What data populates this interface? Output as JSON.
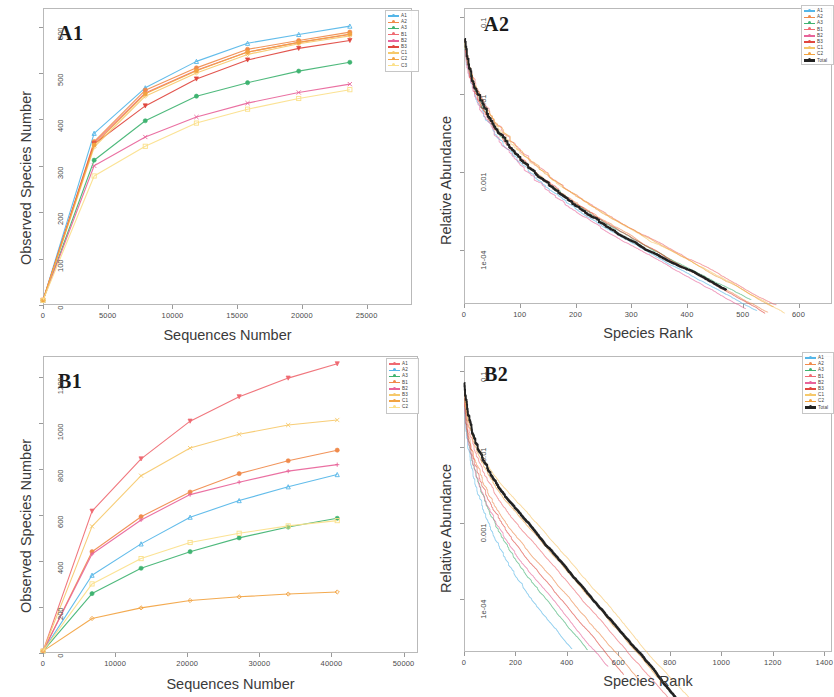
{
  "figure": {
    "width": 832,
    "height": 697,
    "background": "#ffffff"
  },
  "palette": {
    "A1": "#55b6e8",
    "A2": "#f08a4b",
    "A3": "#3fb371",
    "B1": "#ef6a72",
    "B2": "#e8649a",
    "B3": "#e0473f",
    "C1": "#f6c96b",
    "C2": "#f2a341",
    "C3": "#fbe08a",
    "total": "#222222"
  },
  "panels": [
    {
      "id": "A1",
      "tag": "A1",
      "chart_data": {
        "type": "line",
        "title": "A1",
        "xlabel": "Sequences Number",
        "ylabel": "Observed Species Number",
        "xlim": [
          0,
          28500
        ],
        "ylim": [
          0,
          640
        ],
        "xticks": [
          0,
          5000,
          10000,
          15000,
          20000,
          25000
        ],
        "yticks": [
          0,
          100,
          200,
          300,
          400,
          500,
          600
        ],
        "grid": false,
        "legend_position": "top-right",
        "x": [
          0,
          3950,
          7900,
          11850,
          15800,
          19750,
          23700
        ],
        "series": [
          {
            "name": "A1",
            "color": "#55b6e8",
            "marker": "triangle",
            "values": [
              10,
              370,
              468,
              525,
              564,
              583,
              601
            ]
          },
          {
            "name": "A2",
            "color": "#f08a4b",
            "marker": "circle",
            "values": [
              10,
              352,
              463,
              511,
              551,
              570,
              588
            ]
          },
          {
            "name": "A3",
            "color": "#3fb371",
            "marker": "circle",
            "values": [
              10,
              312,
              397,
              450,
              479,
              504,
              523
            ]
          },
          {
            "name": "B1",
            "color": "#ef6a72",
            "marker": "plus",
            "values": [
              10,
              349,
              457,
              506,
              545,
              566,
              583
            ]
          },
          {
            "name": "B2",
            "color": "#e8649a",
            "marker": "cross",
            "values": [
              10,
              300,
              362,
              405,
              435,
              458,
              476
            ]
          },
          {
            "name": "B3",
            "color": "#e0473f",
            "marker": "triangle-down",
            "values": [
              10,
              347,
              429,
              487,
              528,
              553,
              570
            ]
          },
          {
            "name": "C1",
            "color": "#f6c96b",
            "marker": "diamond",
            "values": [
              10,
              340,
              450,
              500,
              540,
              563,
              580
            ]
          },
          {
            "name": "C2",
            "color": "#f2a341",
            "marker": "circle",
            "values": [
              10,
              345,
              455,
              505,
              545,
              566,
              584
            ]
          },
          {
            "name": "C3",
            "color": "#fbe08a",
            "marker": "square",
            "values": [
              10,
              278,
              342,
              392,
              422,
              445,
              464
            ]
          }
        ],
        "legend": [
          "A1",
          "A2",
          "A3",
          "B1",
          "B2",
          "B3",
          "C1",
          "C2",
          "C3"
        ]
      }
    },
    {
      "id": "A2",
      "tag": "A2",
      "chart_data": {
        "type": "line",
        "title": "A2",
        "xlabel": "Species Rank",
        "ylabel": "Relative Abundance",
        "xlim": [
          0,
          660
        ],
        "ylim": [
          2e-05,
          0.13
        ],
        "yscale": "log",
        "xticks": [
          0,
          100,
          200,
          300,
          400,
          500,
          600
        ],
        "yticks": [
          0.1,
          0.01,
          0.001,
          0.0001
        ],
        "ytick_labels": [
          "0.1",
          "0.01",
          "0.001",
          "1e-04"
        ],
        "grid": false,
        "legend_position": "top-right",
        "legend": [
          "A1",
          "A2",
          "A3",
          "B1",
          "B2",
          "B3",
          "C1",
          "C2",
          "Total"
        ],
        "series": [
          {
            "name": "A1",
            "color": "#55b6e8",
            "tail_rank": 525
          },
          {
            "name": "A2",
            "color": "#f08a4b",
            "tail_rank": 545
          },
          {
            "name": "A3",
            "color": "#3fb371",
            "tail_rank": 515
          },
          {
            "name": "B1",
            "color": "#ef6a72",
            "tail_rank": 560
          },
          {
            "name": "B2",
            "color": "#e8649a",
            "tail_rank": 505
          },
          {
            "name": "B3",
            "color": "#e0473f",
            "tail_rank": 540
          },
          {
            "name": "C1",
            "color": "#f6c96b",
            "tail_rank": 575
          },
          {
            "name": "C2",
            "color": "#f2a341",
            "tail_rank": 555
          },
          {
            "name": "Total",
            "color": "#222222",
            "tail_rank": 470,
            "emphasis": true
          }
        ]
      }
    },
    {
      "id": "B1",
      "tag": "B1",
      "chart_data": {
        "type": "line",
        "title": "B1",
        "xlabel": "Sequences Number",
        "ylabel": "Observed Species Number",
        "xlim": [
          0,
          52000
        ],
        "ylim": [
          0,
          1290
        ],
        "xticks": [
          0,
          10000,
          20000,
          30000,
          40000,
          50000
        ],
        "yticks": [
          0,
          200,
          400,
          600,
          800,
          1000,
          1200
        ],
        "grid": false,
        "legend_position": "top-right",
        "x": [
          0,
          6800,
          13600,
          20400,
          27200,
          34000,
          40800
        ],
        "series": [
          {
            "name": "A1",
            "color": "#ef6a72",
            "marker": "triangle-down",
            "values": [
              8,
              616,
              843,
              1007,
              1113,
              1194,
              1256
            ]
          },
          {
            "name": "A2",
            "color": "#55b6e8",
            "marker": "triangle",
            "values": [
              8,
              338,
              474,
              590,
              662,
              722,
              775
            ]
          },
          {
            "name": "A3",
            "color": "#3fb371",
            "marker": "circle",
            "values": [
              8,
              258,
              368,
              440,
              500,
              547,
              585
            ]
          },
          {
            "name": "B1",
            "color": "#f08a4b",
            "marker": "circle",
            "values": [
              8,
              440,
              592,
              699,
              779,
              835,
              881
            ]
          },
          {
            "name": "B2",
            "color": "#e8649a",
            "marker": "plus",
            "values": [
              8,
              430,
              578,
              688,
              742,
              790,
              818
            ]
          },
          {
            "name": "B3",
            "color": "#f6c96b",
            "marker": "cross",
            "values": [
              8,
              550,
              770,
              890,
              950,
              990,
              1012
            ]
          },
          {
            "name": "C1",
            "color": "#f2a341",
            "marker": "diamond",
            "values": [
              8,
              150,
              196,
              228,
              244,
              256,
              265
            ]
          },
          {
            "name": "C2",
            "color": "#fbe08a",
            "marker": "square",
            "values": [
              8,
              300,
              410,
              480,
              520,
              552,
              575
            ]
          }
        ],
        "legend": [
          "A1",
          "A2",
          "A3",
          "B1",
          "B2",
          "B3",
          "C1",
          "C2"
        ]
      }
    },
    {
      "id": "B2",
      "tag": "B2",
      "chart_data": {
        "type": "line",
        "title": "B2",
        "xlabel": "Species Rank",
        "ylabel": "Relative Abundance",
        "xlim": [
          0,
          1430
        ],
        "ylim": [
          2e-05,
          0.16
        ],
        "yscale": "log",
        "xticks": [
          0,
          200,
          400,
          600,
          800,
          1000,
          1200,
          1400
        ],
        "yticks": [
          0.1,
          0.01,
          0.001,
          0.0001
        ],
        "ytick_labels": [
          "0.1",
          "0.01",
          "0.001",
          "1e-04"
        ],
        "grid": false,
        "legend_position": "top-right",
        "legend": [
          "A1",
          "A2",
          "A3",
          "B1",
          "B2",
          "B3",
          "C1",
          "C2",
          "Total"
        ],
        "series": [
          {
            "name": "A1",
            "color": "#55b6e8",
            "tail_rank": 420
          },
          {
            "name": "A2",
            "color": "#f08a4b",
            "tail_rank": 700
          },
          {
            "name": "A3",
            "color": "#3fb371",
            "tail_rank": 480
          },
          {
            "name": "B1",
            "color": "#ef6a72",
            "tail_rank": 800
          },
          {
            "name": "B2",
            "color": "#e8649a",
            "tail_rank": 560
          },
          {
            "name": "B3",
            "color": "#e0473f",
            "tail_rank": 620
          },
          {
            "name": "C1",
            "color": "#f6c96b",
            "tail_rank": 1250
          },
          {
            "name": "C2",
            "color": "#f2a341",
            "tail_rank": 950
          },
          {
            "name": "Total",
            "color": "#222222",
            "tail_rank": 870,
            "emphasis": true
          }
        ]
      }
    }
  ]
}
